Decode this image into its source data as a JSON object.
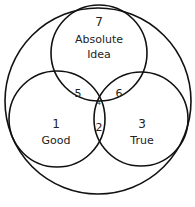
{
  "diagram": {
    "type": "venn",
    "outer": {
      "label": ""
    },
    "sets": [
      {
        "id": "top",
        "number": "7",
        "label_lines": [
          "Absolute",
          "Idea"
        ]
      },
      {
        "id": "left",
        "number": "1",
        "label": "Good"
      },
      {
        "id": "right",
        "number": "3",
        "label": "True"
      }
    ],
    "intersections": [
      {
        "sets": [
          "top",
          "left"
        ],
        "number": "5"
      },
      {
        "sets": [
          "top",
          "right"
        ],
        "number": "6"
      },
      {
        "sets": [
          "left",
          "right"
        ],
        "number": "2"
      },
      {
        "sets": [
          "top",
          "left",
          "right"
        ],
        "number": "4"
      }
    ],
    "colors": {
      "stroke": "#111111",
      "text": "#222222",
      "background": "#ffffff"
    }
  }
}
